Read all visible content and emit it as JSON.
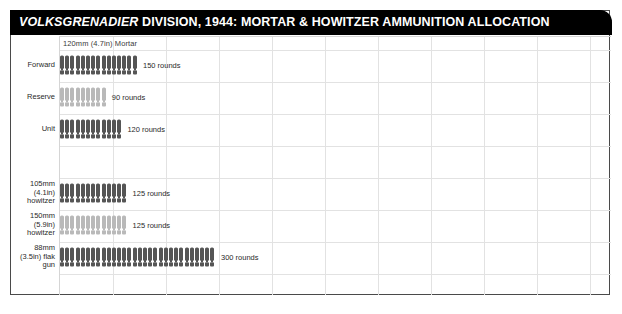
{
  "title": {
    "emphasis": "VOLKSGRENADIER",
    "rest": " DIVISION, 1944: MORTAR & HOWITZER AMMUNITION ALLOCATION",
    "full": "VOLKSGRENADIER DIVISION, 1944: MORTAR & HOWITZER AMMUNITION ALLOCATION"
  },
  "colors": {
    "title_bar": "#000000",
    "title_text": "#ffffff",
    "frame": "#4a4a4a",
    "grid": "#e2e2e2",
    "icon_dark": "#555555",
    "icon_light": "#b9b9b9",
    "label_text": "#2a2a2a"
  },
  "chart_data": {
    "type": "bar",
    "title": "VOLKSGRENADIER DIVISION, 1944: MORTAR & HOWITZER AMMUNITION ALLOCATION",
    "subtitle": "120mm (4.7in) Mortar",
    "xlabel": "",
    "ylabel": "",
    "grid": true,
    "legend": "none",
    "units": "rounds",
    "rounds_per_icon": 10,
    "xlim": [
      0,
      600
    ],
    "categories": [
      "Forward",
      "Reserve",
      "Unit",
      "105mm (4.1in) howitzer",
      "150mm (5.9in) howitzer",
      "88mm (3.5in) flak gun"
    ],
    "values": [
      150,
      90,
      120,
      125,
      125,
      300
    ],
    "value_labels": [
      "150 rounds",
      "90 rounds",
      "120 rounds",
      "125 rounds",
      "125 rounds",
      "300 rounds"
    ]
  },
  "rows": [
    {
      "name": "forward",
      "label_lines": [
        "Forward"
      ],
      "value": 150,
      "value_label": "150 rounds",
      "icons": 15,
      "shade": "dark",
      "top": 13
    },
    {
      "name": "reserve",
      "label_lines": [
        "Reserve"
      ],
      "value": 90,
      "value_label": "90 rounds",
      "icons": 9,
      "shade": "light",
      "top": 45
    },
    {
      "name": "unit",
      "label_lines": [
        "Unit"
      ],
      "value": 120,
      "value_label": "120 rounds",
      "icons": 12,
      "shade": "dark",
      "top": 77
    },
    {
      "name": "howitzer-105mm",
      "label_lines": [
        "105mm",
        "(4.1in)",
        "howitzer"
      ],
      "value": 125,
      "value_label": "125 rounds",
      "icons": 13,
      "shade": "dark",
      "top": 141
    },
    {
      "name": "howitzer-150mm",
      "label_lines": [
        "150mm",
        "(5.9in)",
        "howitzer"
      ],
      "value": 125,
      "value_label": "125 rounds",
      "icons": 13,
      "shade": "light",
      "top": 173
    },
    {
      "name": "flak-gun-88mm",
      "label_lines": [
        "88mm",
        "(3.5in) flak",
        "gun"
      ],
      "value": 300,
      "value_label": "300 rounds",
      "icons": 30,
      "shade": "dark",
      "top": 205
    }
  ],
  "grid_lines": {
    "vertical_x": [
      53,
      106,
      159,
      212,
      265,
      318,
      371,
      424,
      477,
      530
    ],
    "horizontal_y": [
      13,
      45,
      77,
      109,
      141,
      173,
      205,
      237
    ]
  }
}
